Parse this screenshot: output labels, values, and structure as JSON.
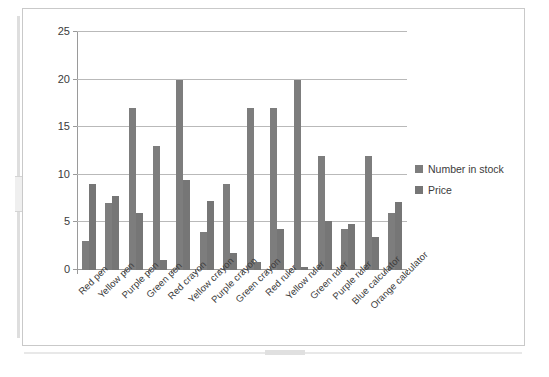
{
  "chart_data": {
    "type": "bar",
    "title": "",
    "xlabel": "",
    "ylabel": "",
    "ylim": [
      0,
      25
    ],
    "yticks": [
      0,
      5,
      10,
      15,
      20,
      25
    ],
    "grid": true,
    "legend_position": "right",
    "categories": [
      "Red pen",
      "Yellow pen",
      "Purple pen",
      "Green pen",
      "Red crayon",
      "Yellow crayon",
      "Purple crayon",
      "Green crayon",
      "Red ruler",
      "Yellow ruler",
      "Green ruler",
      "Purple ruler",
      "Blue calculator",
      "Orange calculator"
    ],
    "series": [
      {
        "name": "Number in stock",
        "color": "#7d7d7d",
        "values": [
          3,
          7,
          17,
          13,
          20,
          4,
          9,
          17,
          17,
          20,
          12,
          4.3,
          12,
          6
        ]
      },
      {
        "name": "Price",
        "color": "#767676",
        "values": [
          9,
          7.8,
          6,
          1,
          9.5,
          7.2,
          1.8,
          0.8,
          4.3,
          0.3,
          5.2,
          4.8,
          3.5,
          7.1
        ]
      }
    ]
  },
  "legend": {
    "items": [
      {
        "label": "Number in stock"
      },
      {
        "label": "Price"
      }
    ]
  }
}
